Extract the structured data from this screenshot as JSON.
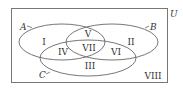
{
  "diagram": {
    "universe_label": "U",
    "sets": [
      {
        "name": "A",
        "cx": 62,
        "cy": 42,
        "rx": 43,
        "ry": 18
      },
      {
        "name": "B",
        "cx": 112,
        "cy": 42,
        "rx": 46,
        "ry": 18
      },
      {
        "name": "C",
        "cx": 88,
        "cy": 58,
        "rx": 48,
        "ry": 18
      }
    ],
    "regions": [
      {
        "label": "I",
        "x": 44,
        "y": 45
      },
      {
        "label": "II",
        "x": 131,
        "y": 45
      },
      {
        "label": "III",
        "x": 90,
        "y": 69
      },
      {
        "label": "IV",
        "x": 63,
        "y": 55
      },
      {
        "label": "V",
        "x": 88,
        "y": 37
      },
      {
        "label": "VI",
        "x": 116,
        "y": 55
      },
      {
        "label": "VII",
        "x": 89,
        "y": 51
      },
      {
        "label": "VIII",
        "x": 153,
        "y": 79
      }
    ],
    "colors": {
      "stroke": "#666666",
      "text": "#333333"
    }
  }
}
